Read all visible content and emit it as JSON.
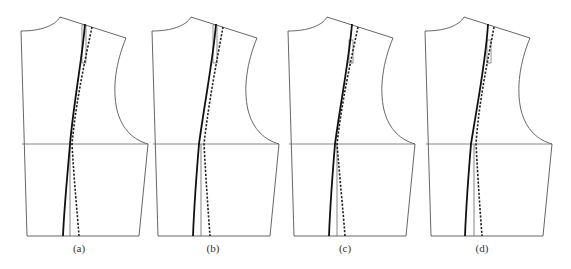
{
  "figure": {
    "panels": [
      {
        "id": "a",
        "label": "(a)",
        "offset_x": 0,
        "label_x": 79
      },
      {
        "id": "b",
        "label": "(b)",
        "offset_x": 131,
        "label_x": 213
      },
      {
        "id": "c",
        "label": "(c)",
        "offset_x": 267,
        "label_x": 345
      },
      {
        "id": "d",
        "label": "(d)",
        "offset_x": 404,
        "label_x": 482
      }
    ],
    "colors": {
      "outline": "#555555",
      "seam": "#111111",
      "background": "#ffffff"
    },
    "legend": {
      "solid_line": "adjusted seam line",
      "dashed_line": "original seam line"
    }
  }
}
